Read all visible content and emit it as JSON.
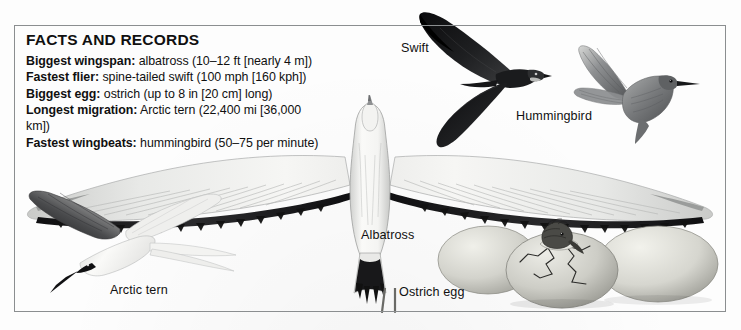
{
  "panel": {
    "title": "FACTS AND RECORDS",
    "facts": [
      {
        "label": "Biggest wingspan:",
        "value": "albatross (10–12 ft [nearly 4 m])"
      },
      {
        "label": "Fastest flier:",
        "value": "spine-tailed swift (100 mph [160 kph])"
      },
      {
        "label": "Biggest egg:",
        "value": "ostrich (up to 8 in [20 cm] long)"
      },
      {
        "label": "Longest migration:",
        "value": "Arctic tern (22,400 mi [36,000 km])"
      },
      {
        "label": "Fastest wingbeats:",
        "value": "hummingbird (50–75 per minute)"
      }
    ]
  },
  "labels": {
    "swift": "Swift",
    "hummingbird": "Hummingbird",
    "albatross": "Albatross",
    "arctic_tern": "Arctic tern",
    "ostrich_egg": "Ostrich egg"
  },
  "colors": {
    "frame": "#8b8e90",
    "text": "#101010",
    "paper": "#fdfdfd",
    "swift_dark": "#15151a",
    "albatross_light": "#f2f2f0",
    "albatross_shade": "#b9bbbb",
    "wingtip_black": "#1a1a1c",
    "egg_light": "#dcdcd6",
    "egg_shade": "#9d9d97",
    "hummingbird_gray": "#77787a"
  }
}
